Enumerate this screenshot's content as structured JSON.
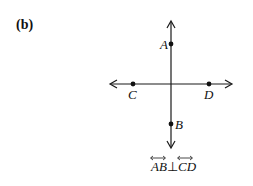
{
  "figure": {
    "label": "(b)",
    "points": {
      "A": "A",
      "B": "B",
      "C": "C",
      "D": "D"
    },
    "caption": {
      "line1": "AB",
      "symbol": "⊥",
      "line2": "CD",
      "text": "AB ⊥ CD"
    },
    "colors": {
      "stroke": "#1a1a1a",
      "background": "#ffffff"
    }
  }
}
